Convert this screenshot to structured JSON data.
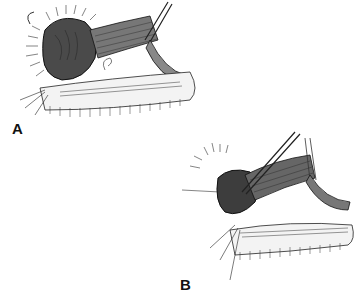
{
  "figure": {
    "panels": [
      {
        "id": "A",
        "label": "A",
        "description": "Surgical illustration: eyelid with everted tissue and muscle strip retracted by forceps"
      },
      {
        "id": "B",
        "label": "B",
        "description": "Surgical illustration: forceps grasping tissue near lid margin with sutures"
      }
    ],
    "colors": {
      "ink": "#1a1a1a",
      "shade": "#555555",
      "background": "#ffffff"
    }
  }
}
